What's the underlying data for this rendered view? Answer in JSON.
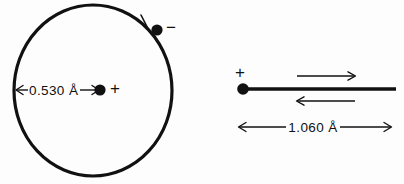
{
  "figure": {
    "background_color": "#fdfdfd",
    "ink_color": "#111111",
    "panels": {
      "left": {
        "name": "bohr-orbit-model",
        "orbit": {
          "center_x": 93,
          "center_y": 90.5,
          "radius_x": 79,
          "radius_y": 85.5,
          "stroke_width": 3.2
        },
        "nucleus": {
          "x": 100,
          "y": 90,
          "radius": 5.6,
          "charge_label": "+",
          "charge_label_x": 114,
          "charge_label_y": 88
        },
        "electron": {
          "x": 157,
          "y": 30,
          "radius": 5.6,
          "charge_label": "−",
          "charge_label_x": 168,
          "charge_label_y": 27
        },
        "motion_tick": {
          "name": "orbit-direction-tick",
          "x1": 141,
          "y1": 16,
          "x2": 149,
          "y2": 31
        },
        "radius_dimension": {
          "label": "0.530 Å",
          "label_x": 26,
          "label_y": 95,
          "line_y": 90,
          "x_start": 15,
          "x_end": 99,
          "arrow_left": true,
          "arrow_right": true
        }
      },
      "right": {
        "name": "bond-length-model",
        "bond_line": {
          "x_start": 243,
          "x_end": 395,
          "y": 89,
          "stroke_width": 3.4
        },
        "nucleus": {
          "x": 243,
          "y": 89,
          "radius": 5.8,
          "charge_label": "+",
          "charge_label_x": 238,
          "charge_label_y": 72
        },
        "arrow_upper": {
          "name": "vibration-arrow-right",
          "x_start": 297,
          "x_end": 355,
          "y": 76,
          "direction": "right"
        },
        "arrow_lower": {
          "name": "vibration-arrow-left",
          "x_start": 355,
          "x_end": 297,
          "y": 101,
          "direction": "left"
        },
        "length_dimension": {
          "label": "1.060 Å",
          "label_x": 290,
          "label_y": 132,
          "line_y": 127,
          "x_start": 238,
          "x_end": 392,
          "arrow_left": true,
          "arrow_right": true
        }
      }
    }
  }
}
